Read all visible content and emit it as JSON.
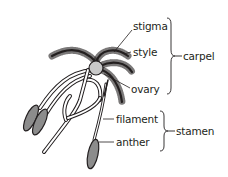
{
  "diagram": {
    "labels": {
      "stigma": "stigma",
      "style": "style",
      "ovary": "ovary",
      "filament": "filament",
      "anther": "anther",
      "carpel": "carpel",
      "stamen": "stamen"
    },
    "groups": [
      {
        "name": "carpel",
        "members": [
          "stigma",
          "style",
          "ovary"
        ]
      },
      {
        "name": "stamen",
        "members": [
          "filament",
          "anther"
        ]
      }
    ],
    "colors": {
      "outline": "#231f20",
      "fill_light": "#ffffff",
      "anther_fill": "#8c8c8c",
      "ovary_fill": "#c8c8c8"
    }
  }
}
